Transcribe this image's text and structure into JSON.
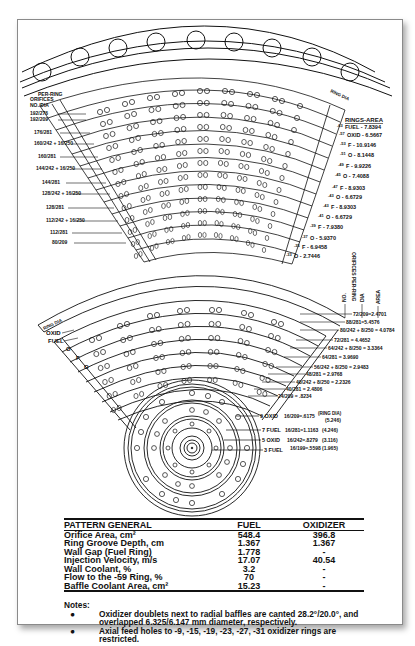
{
  "diagram": {
    "title_area": {
      "left_header": [
        "PER-RING",
        "ORIFICES",
        "NO./DIA"
      ],
      "top_right_header": "RING DIA",
      "rings_area_header": "RINGS-AREA"
    },
    "upper_left_labels": [
      "192/276",
      "192/209",
      "176/281",
      "160/242 + 16/250",
      "160/281",
      "144/242 + 16/250",
      "144/281",
      "128/242 + 16/250",
      "144/281",
      "128/242 + 16/250",
      "128/281",
      "112/242 + 16/250",
      "112/281",
      "80/209"
    ],
    "upper_right_labels": [
      {
        "ring": "-63",
        "label": "FUEL - 7.8394"
      },
      {
        "ring": "-57",
        "label": "OXID - 6.5667"
      },
      {
        "ring": "-53",
        "label": "F - 10.9146"
      },
      {
        "ring": "-51",
        "label": "O - 8.1448"
      },
      {
        "ring": "-49",
        "label": "F - 9.9226"
      },
      {
        "ring": "-45",
        "label": "O - 7.4088"
      },
      {
        "ring": "-47",
        "label": "F - 8.9303"
      },
      {
        "ring": "-43",
        "label": "O - 6.6729"
      },
      {
        "ring": "-43",
        "label": "F - 8.9303"
      },
      {
        "ring": "-41",
        "label": "O - 6.6729"
      },
      {
        "ring": "-39",
        "label": "F - 7.9380"
      },
      {
        "ring": "-37",
        "label": "O - 5.9370"
      },
      {
        "ring": "-35",
        "label": "F - 6.9458"
      },
      {
        "ring": "-33",
        "label": "O - 2.7446"
      }
    ],
    "per_ring_header": [
      "ORIFICES PER-RING",
      "NO.",
      "DIA",
      "AREA"
    ],
    "lower_left_labels": [
      "RING DIA",
      "OXID",
      "FUEL",
      "O",
      "F",
      "O"
    ],
    "lower_right_labels": [
      "72/209=2.4701",
      "88/281=5.4576",
      "80/242 + 8/250 = 4.0784",
      "72/281 = 4.4652",
      "64/242 + 8/250 = 3.3364",
      "64/281 = 3.9690",
      "56/242 + 8/250 = 2.9483",
      "48/281 = 2.9768",
      "40/242 + 8/250 = 2.2326",
      "40/281 = 2.4806",
      "24/209 = .8234"
    ],
    "core_labels": [
      {
        "ring": "9 OXID",
        "spec": "16/209=.6175",
        "dia": "(5.246)"
      },
      {
        "ring": "7 FUEL",
        "spec": "16/281=1.1163",
        "dia": "(4.246)"
      },
      {
        "ring": "5 OXID",
        "spec": "16/242=.8279",
        "dia": "(3.116)"
      },
      {
        "ring": "3 FUEL",
        "spec": "16/199=.5598",
        "dia": "(1.965)"
      }
    ],
    "core_dia_header": "(RING DIA)"
  },
  "table": {
    "headers": [
      "PATTERN GENERAL",
      "FUEL",
      "OXIDIZER"
    ],
    "rows": [
      [
        "Orifice Area, cm²",
        "548.4",
        "396.8"
      ],
      [
        "Ring Groove Depth, cm",
        "1.367",
        "1.367"
      ],
      [
        "Wall Gap (Fuel Ring)",
        "1.778",
        "-"
      ],
      [
        "Injection Velocity, m/s",
        "17.07",
        "40.54"
      ],
      [
        "Wall Coolant, %",
        "3.2",
        "-"
      ],
      [
        "Flow to the -59 Ring, %",
        "70",
        "-"
      ],
      [
        "Baffle Coolant Area, cm²",
        "15.23",
        "-"
      ]
    ]
  },
  "notes": {
    "heading": "Notes:",
    "items": [
      {
        "bullet": "●",
        "text": "Oxidizer doublets next to radial baffles are canted 28.2°/20.0°, and overlapped 6.325/6.147 mm diameter, respectively."
      },
      {
        "bullet": "●",
        "text": "Axial feed holes to -9, -15, -19, -23, -27, -31 oxidizer rings are restricted."
      }
    ]
  }
}
